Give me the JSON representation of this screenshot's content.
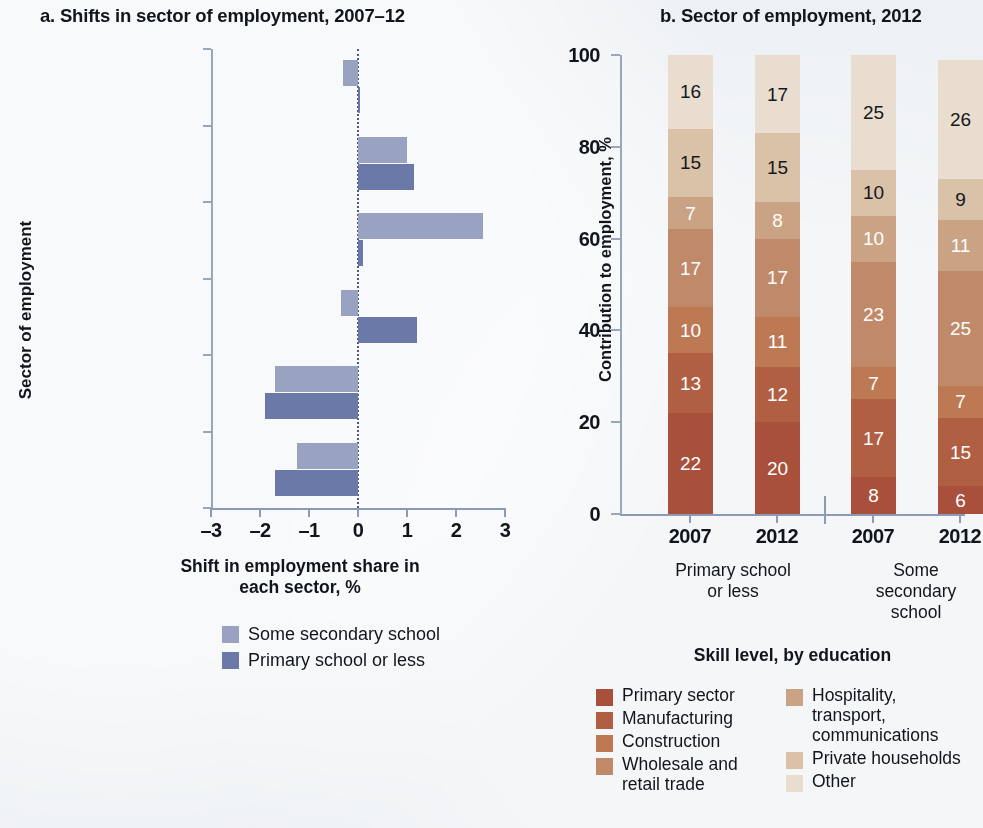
{
  "panel_a": {
    "title": "a. Shifts in sector of employment, 2007–12",
    "ylabel": "Sector of employment",
    "xlabel": "Shift in employment\nshare in each sector, %",
    "legend": [
      {
        "label": "Some secondary school",
        "color": "#9aa2c1"
      },
      {
        "label": "Primary school or less",
        "color": "#6b79a8"
      }
    ]
  },
  "panel_b": {
    "title": "b. Sector of employment, 2012",
    "ylabel": "Contribution to employment, %",
    "xlabel": "Skill level, by education",
    "group_labels": [
      "Primary school\nor less",
      "Some\nsecondary\nschool"
    ],
    "legend_col1": [
      {
        "label": "Primary sector",
        "color": "#a8503c"
      },
      {
        "label": "Manufacturing",
        "color": "#b05f43"
      },
      {
        "label": "Construction",
        "color": "#bc7954"
      },
      {
        "label": "Wholesale and\nretail trade",
        "color": "#c08a6a"
      }
    ],
    "legend_col2": [
      {
        "label": "Hospitality,\ntransport,\ncommunications",
        "color": "#c9a383"
      },
      {
        "label": "Private households",
        "color": "#d9c2a8"
      },
      {
        "label": "Other",
        "color": "#e8ddcf"
      }
    ]
  },
  "chart_data": [
    {
      "type": "bar",
      "orientation": "horizontal",
      "title": "a. Shifts in sector of employment, 2007–12",
      "xlabel": "Shift in employment share in each sector, %",
      "ylabel": "Sector of employment",
      "xlim": [
        -3,
        3
      ],
      "xticks": [
        "–3",
        "–2",
        "–1",
        "0",
        "1",
        "2",
        "3"
      ],
      "xtick_values": [
        -3,
        -2,
        -1,
        0,
        1,
        2,
        3
      ],
      "grid": false,
      "legend_position": "bottom",
      "categories": [
        "Private households",
        "Hospitality,\ntransport, and\ncommunications",
        "Wholesale and\nretail trade",
        "Construction",
        "Manufacturing",
        "Primary sector"
      ],
      "series": [
        {
          "name": "Some secondary school",
          "color": "#9aa2c1",
          "values": [
            -0.3,
            1.0,
            2.55,
            -0.35,
            -1.7,
            -1.25
          ]
        },
        {
          "name": "Primary school or less",
          "color": "#6b79a8",
          "values": [
            0.03,
            1.15,
            0.1,
            1.2,
            -1.9,
            -1.7
          ]
        }
      ]
    },
    {
      "type": "bar",
      "stacked": true,
      "orientation": "vertical",
      "title": "b. Sector of employment, 2012",
      "xlabel": "Skill level, by education",
      "ylabel": "Contribution to employment, %",
      "ylim": [
        0,
        100
      ],
      "yticks": [
        "0",
        "20",
        "40",
        "60",
        "80",
        "100"
      ],
      "ytick_values": [
        0,
        20,
        40,
        60,
        80,
        100
      ],
      "grid": false,
      "legend_position": "bottom",
      "categories": [
        "2007",
        "2012",
        "2007",
        "2012"
      ],
      "groups": [
        {
          "name": "Primary school or less",
          "categories": [
            "2007",
            "2012"
          ]
        },
        {
          "name": "Some secondary school",
          "categories": [
            "2007",
            "2012"
          ]
        }
      ],
      "series": [
        {
          "name": "Primary sector",
          "color": "#a8503c",
          "values": [
            22,
            20,
            8,
            6
          ]
        },
        {
          "name": "Manufacturing",
          "color": "#b05f43",
          "values": [
            13,
            12,
            17,
            15
          ]
        },
        {
          "name": "Construction",
          "color": "#bc7954",
          "values": [
            10,
            11,
            7,
            7
          ]
        },
        {
          "name": "Wholesale and retail trade",
          "color": "#c08a6a",
          "values": [
            17,
            17,
            23,
            25
          ]
        },
        {
          "name": "Hospitality, transport, communications",
          "color": "#c9a383",
          "values": [
            7,
            8,
            10,
            11
          ]
        },
        {
          "name": "Private households",
          "color": "#d9c2a8",
          "values": [
            15,
            15,
            10,
            9
          ]
        },
        {
          "name": "Other",
          "color": "#e8ddcf",
          "values": [
            16,
            17,
            25,
            26
          ]
        }
      ]
    }
  ]
}
